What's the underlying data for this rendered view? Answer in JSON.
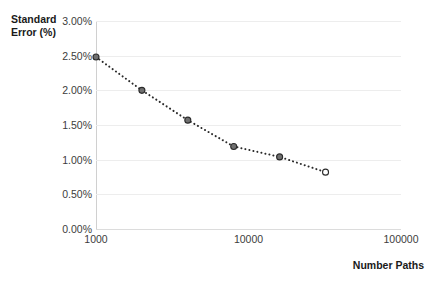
{
  "chart_data": {
    "type": "line",
    "title": "",
    "subtitle": "",
    "xlabel": "Number Paths",
    "ylabel": "Standard Error (%)",
    "xscale": "log",
    "yscale": "linear",
    "xlim": [
      1000,
      100000
    ],
    "ylim": [
      0.0,
      3.0
    ],
    "grid": true,
    "legend": false,
    "legend_position": "none",
    "x_tick_labels": [
      "1000",
      "10000",
      "100000"
    ],
    "x_tick_values": [
      1000,
      10000,
      100000
    ],
    "y_tick_labels": [
      "0.00%",
      "0.50%",
      "1.00%",
      "1.50%",
      "2.00%",
      "2.50%",
      "3.00%"
    ],
    "y_tick_values": [
      0.0,
      0.5,
      1.0,
      1.5,
      2.0,
      2.5,
      3.0
    ],
    "series": [
      {
        "name": "Standard Error",
        "line_style": "dotted",
        "color": "#2b2b2b",
        "x": [
          1000,
          2000,
          4000,
          8000,
          16000,
          32000
        ],
        "y": [
          2.48,
          2.0,
          1.57,
          1.19,
          1.04,
          0.82
        ],
        "marker_filled": [
          true,
          true,
          true,
          true,
          true,
          false
        ]
      }
    ]
  },
  "axes": {
    "y_title": "Standard\nError (%)",
    "x_title": "Number Paths"
  },
  "colors": {
    "background": "#ffffff",
    "gridline": "#ededed",
    "axis_line": "#d0d0d0",
    "text": "#3c3c3c",
    "title_text": "#1a1a1a",
    "series": "#2b2b2b"
  }
}
